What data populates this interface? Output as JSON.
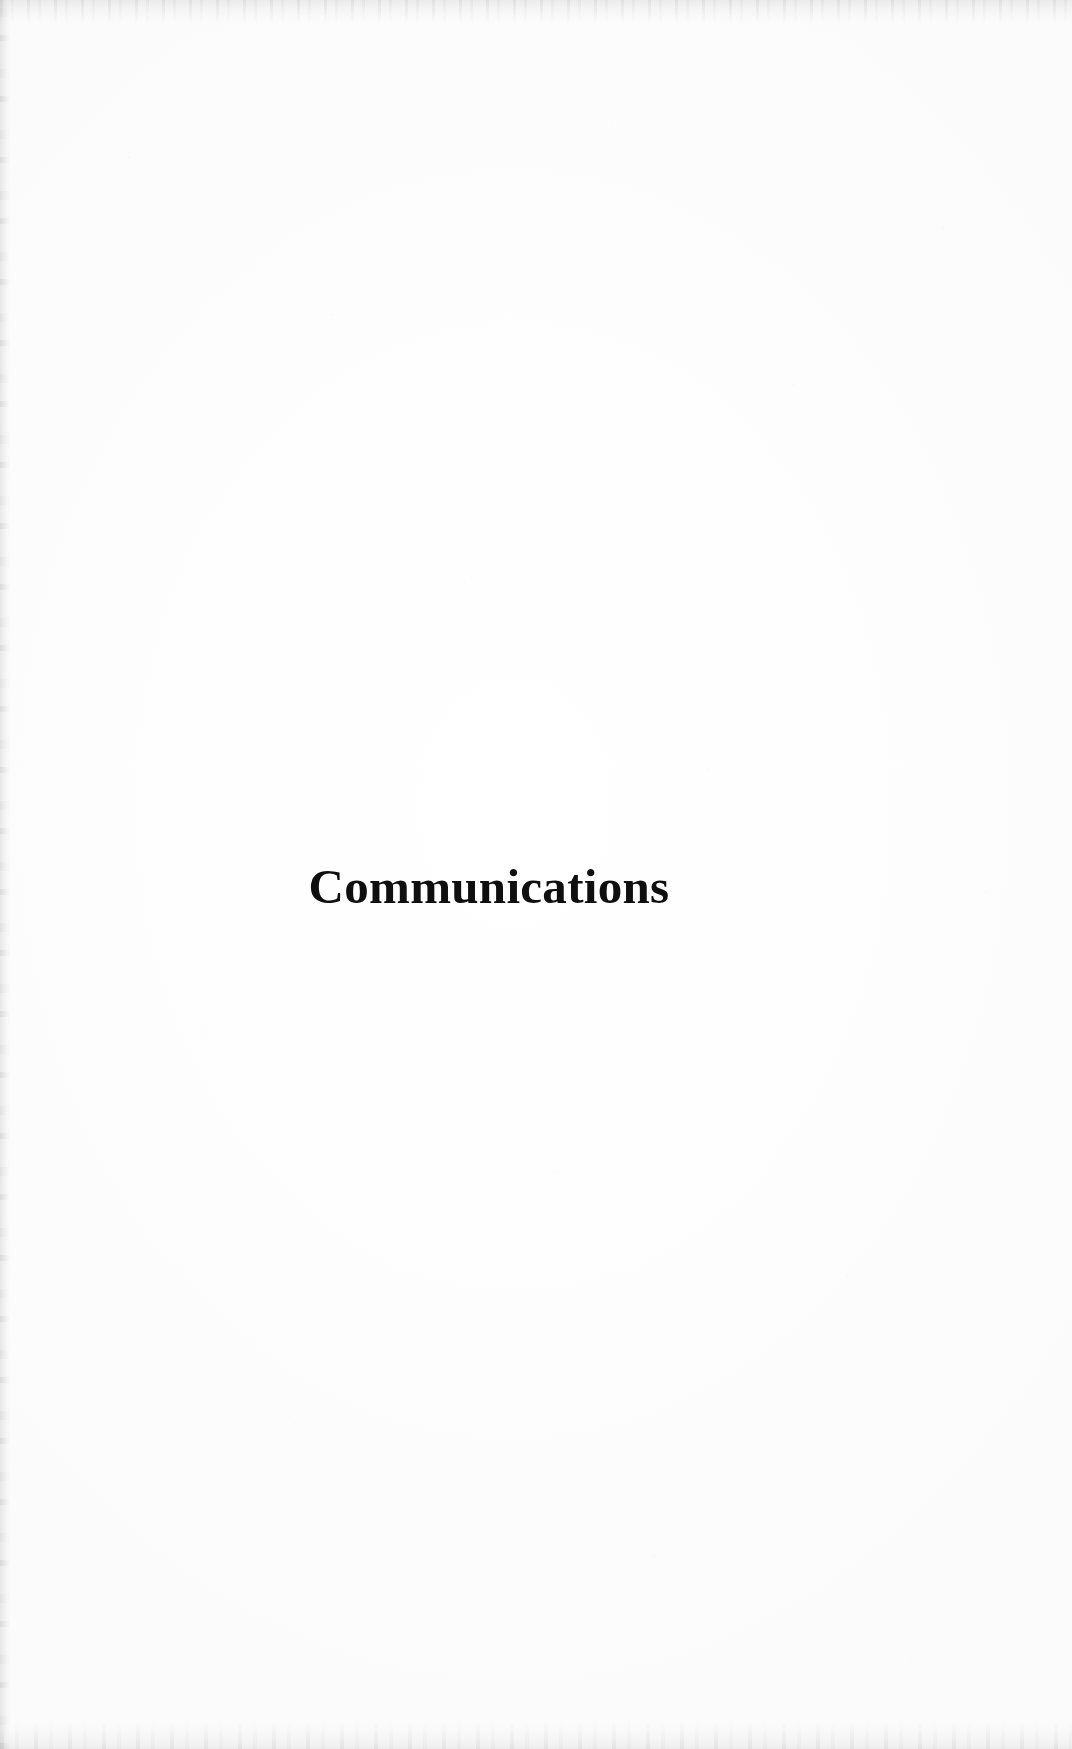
{
  "document": {
    "kind": "scanned-book-page",
    "page_type": "section-divider",
    "background_color": "#fefefe",
    "ink_color": "#100f0f"
  },
  "section": {
    "title": "Communications"
  },
  "artifacts": {
    "top_edge_label": "scan-edge-artifact-top",
    "left_edge_label": "scan-edge-artifact-left",
    "bottom_edge_label": "scan-edge-artifact-bottom",
    "speckle_label": "scan-speckle-artifact"
  }
}
